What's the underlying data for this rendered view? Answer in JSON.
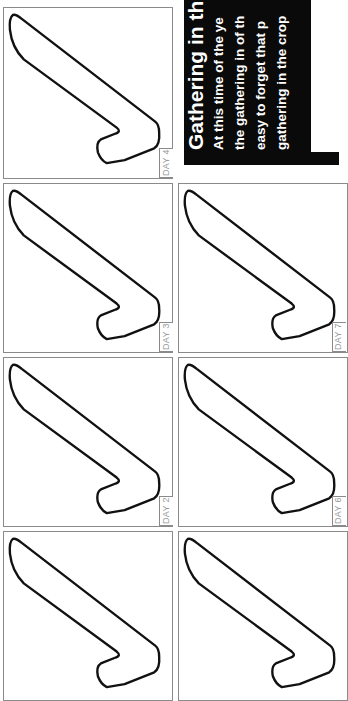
{
  "article": {
    "title": "Gathering in the",
    "lines": [
      "At this time of the ye",
      "the gathering in of th",
      "easy to forget that p",
      "gathering in the crop"
    ]
  },
  "panels": [
    {
      "label": "DAY 4"
    },
    {
      "label": "DAY 3"
    },
    {
      "label": "DAY 7"
    },
    {
      "label": "DAY 2"
    },
    {
      "label": "DAY 6"
    },
    {
      "label": "DAY 1"
    },
    {
      "label": "DAY 5"
    }
  ],
  "colors": {
    "box": "#0a0a0a",
    "border": "#8a8a8a",
    "label": "#9a9a9a",
    "stroke": "#111111"
  }
}
